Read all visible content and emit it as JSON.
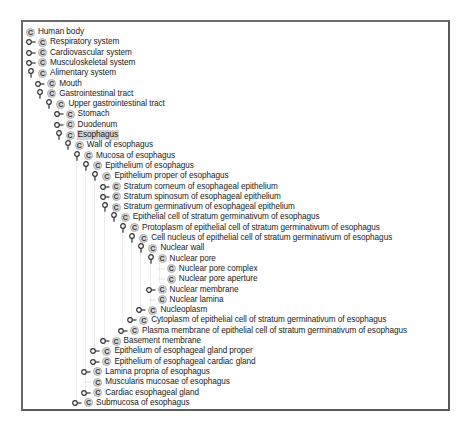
{
  "tree": {
    "selected_label": "Esophagus",
    "nodes": [
      {
        "label": "Human body",
        "depth": 0,
        "toggle": "none"
      },
      {
        "label": "Respiratory system",
        "depth": 1,
        "toggle": "collapsed"
      },
      {
        "label": "Cardiovascular system",
        "depth": 1,
        "toggle": "collapsed"
      },
      {
        "label": "Musculoskeletal system",
        "depth": 1,
        "toggle": "collapsed"
      },
      {
        "label": "Alimentary system",
        "depth": 1,
        "toggle": "expanded"
      },
      {
        "label": "Mouth",
        "depth": 2,
        "toggle": "collapsed"
      },
      {
        "label": "Gastrointestinal tract",
        "depth": 2,
        "toggle": "expanded"
      },
      {
        "label": "Upper gastrointestinal tract",
        "depth": 3,
        "toggle": "expanded"
      },
      {
        "label": "Stomach",
        "depth": 4,
        "toggle": "collapsed"
      },
      {
        "label": "Duodenum",
        "depth": 4,
        "toggle": "collapsed"
      },
      {
        "label": "Esophagus",
        "depth": 4,
        "toggle": "expanded",
        "selected": true
      },
      {
        "label": "Wall of esophagus",
        "depth": 5,
        "toggle": "expanded"
      },
      {
        "label": "Mucosa of esophagus",
        "depth": 6,
        "toggle": "expanded"
      },
      {
        "label": "Epithelium of esophagus",
        "depth": 7,
        "toggle": "expanded"
      },
      {
        "label": "Epithelium proper of esophagus",
        "depth": 8,
        "toggle": "expanded"
      },
      {
        "label": "Stratum corneum of esophageal epithelium",
        "depth": 9,
        "toggle": "collapsed"
      },
      {
        "label": "Stratum spinosum of esophageal epithelium",
        "depth": 9,
        "toggle": "collapsed"
      },
      {
        "label": "Stratum germinativum of esophageal epithelium",
        "depth": 9,
        "toggle": "expanded"
      },
      {
        "label": "Epithelial cell of stratum germinativum of esophagus",
        "depth": 10,
        "toggle": "expanded"
      },
      {
        "label": "Protoplasm of epithelial cell of stratum germinativum of esophagus",
        "depth": 11,
        "toggle": "expanded"
      },
      {
        "label": "Cell nucleus of epithelial cell of stratum germinativum of esophagus",
        "depth": 12,
        "toggle": "expanded"
      },
      {
        "label": "Nuclear wall",
        "depth": 13,
        "toggle": "expanded"
      },
      {
        "label": "Nuclear pore",
        "depth": 14,
        "toggle": "expanded"
      },
      {
        "label": "Nuclear pore complex",
        "depth": 15,
        "toggle": "none"
      },
      {
        "label": "Nuclear pore aperture",
        "depth": 15,
        "toggle": "none"
      },
      {
        "label": "Nuclear membrane",
        "depth": 14,
        "toggle": "collapsed"
      },
      {
        "label": "Nuclear lamina",
        "depth": 14,
        "toggle": "none"
      },
      {
        "label": "Nucleoplasm",
        "depth": 13,
        "toggle": "collapsed"
      },
      {
        "label": "Cytoplasm of epithelial cell of stratum germinativum of esophagus",
        "depth": 12,
        "toggle": "collapsed"
      },
      {
        "label": "Plasma membrane of epithelial cell of stratum germinativum of esophagus",
        "depth": 11,
        "toggle": "collapsed"
      },
      {
        "label": "Basement membrane",
        "depth": 9,
        "toggle": "collapsed"
      },
      {
        "label": "Epithelium of esophageal gland proper",
        "depth": 8,
        "toggle": "collapsed"
      },
      {
        "label": "Epithelium of esophageal cardiac gland",
        "depth": 8,
        "toggle": "collapsed"
      },
      {
        "label": "Lamina propria of esophagus",
        "depth": 7,
        "toggle": "collapsed"
      },
      {
        "label": "Muscularis mucosae of esophagus",
        "depth": 7,
        "toggle": "none"
      },
      {
        "label": "Cardiac esophageal gland",
        "depth": 7,
        "toggle": "collapsed"
      },
      {
        "label": "Submucosa of esophagus",
        "depth": 6,
        "toggle": "collapsed"
      }
    ],
    "class_icon_glyph": "C",
    "colors": {
      "selection": "#d4d4d4",
      "class_icon_bg": "#d9d9d9",
      "frame_border": "#5a5a5a",
      "guide_line": "#ececec"
    }
  }
}
